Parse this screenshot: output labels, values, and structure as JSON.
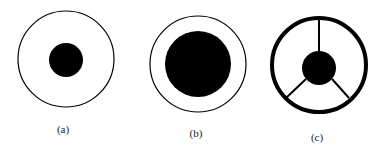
{
  "figure": {
    "panels": [
      {
        "label": "(a)",
        "outer_ring": {
          "cx": 66,
          "cy": 59,
          "r": 48,
          "stroke_width": 1.2
        },
        "inner_disk": {
          "cx": 66,
          "cy": 60,
          "r": 17
        },
        "spokes": 0
      },
      {
        "label": "(b)",
        "outer_ring": {
          "cx": 198,
          "cy": 64,
          "r": 48,
          "stroke_width": 1.2
        },
        "inner_disk": {
          "cx": 198,
          "cy": 64,
          "r": 33
        },
        "spokes": 0
      },
      {
        "label": "(c)",
        "outer_ring": {
          "cx": 319,
          "cy": 65,
          "r": 47,
          "stroke_width": 4
        },
        "inner_disk": {
          "cx": 319,
          "cy": 68,
          "r": 17
        },
        "spokes": 3
      }
    ],
    "colors": {
      "ink": "#000000",
      "background": "#ffffff"
    }
  }
}
